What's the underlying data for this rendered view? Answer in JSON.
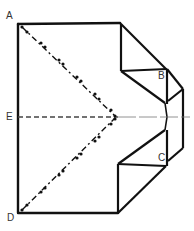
{
  "diagram": {
    "type": "origami-folding-diagram",
    "labels": {
      "A": "A",
      "B": "B",
      "C": "C",
      "D": "D",
      "E": "E"
    },
    "line_styles": {
      "solid_edge": "fold edge",
      "dashed": "valley fold (E centerline)",
      "dash_dot": "mountain fold (A and D diagonals)"
    },
    "colors": {
      "edge": "#111111",
      "dashed": "#444444",
      "label": "#333333",
      "background": "#ffffff"
    }
  }
}
